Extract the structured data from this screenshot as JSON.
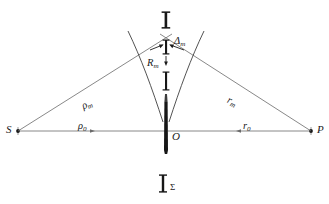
{
  "figure": {
    "type": "optics-diagram",
    "title_visible": false,
    "background_color": "#ffffff",
    "line_color": "#4a4a4a",
    "bar_color": "#1a1a1a",
    "width": 329,
    "height": 204
  },
  "points": [
    {
      "name": "S",
      "label": "S",
      "x": 18,
      "y": 131,
      "side": "left",
      "marker": "dot"
    },
    {
      "name": "O",
      "label": "O",
      "x": 166,
      "y": 131,
      "side": "center",
      "marker": "none"
    },
    {
      "name": "P",
      "label": "P",
      "x": 311,
      "y": 131,
      "side": "right",
      "marker": "dot"
    }
  ],
  "labels": {
    "source_point": "S",
    "origin_point": "O",
    "field_point": "P",
    "axis_left_segment": "ρ",
    "axis_left_segment_sub": "0",
    "axis_right_segment": "r",
    "axis_right_segment_sub": "0",
    "ray_left": "ρ",
    "ray_left_sub": "m",
    "ray_right": "r",
    "ray_right_sub": "m",
    "zone_radius": "R",
    "zone_radius_sub": "m",
    "zone_gap": "Δ",
    "zone_gap_sub": "m",
    "top_marker": "I",
    "bottom_marker_symbol": "Σ"
  },
  "geometry": {
    "axis_y": 131,
    "axis_x_start": 18,
    "axis_x_end": 311,
    "apex_x": 166,
    "apex_y": 36,
    "left_ray": {
      "x1": 18,
      "y1": 131,
      "x2": 170,
      "y2": 36
    },
    "right_ray": {
      "x1": 311,
      "y1": 131,
      "x2": 162,
      "y2": 36
    },
    "curve_left_top": {
      "x": 130,
      "y": 32
    },
    "curve_right_top": {
      "x": 202,
      "y": 32
    },
    "curve_bottom": {
      "x": 166,
      "y": 122
    },
    "center_bar_top_y": 102,
    "center_bar_bottom_y": 153,
    "top_I_bar": {
      "x": 166,
      "y_top": 12,
      "y_bottom": 28
    },
    "bottom_sigma_bar": {
      "x": 163,
      "y_top": 175,
      "y_bottom": 193
    },
    "delta_bar": {
      "x": 166,
      "y_top": 40,
      "y_bottom": 54
    },
    "radius_bar": {
      "x": 166,
      "y_top": 72,
      "y_bottom": 90
    }
  }
}
